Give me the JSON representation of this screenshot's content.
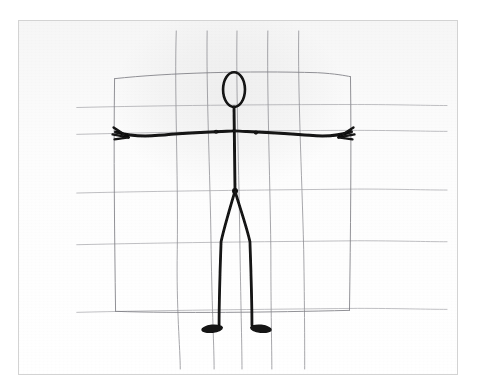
{
  "image": {
    "title": "Pencil sketch of a stick figure",
    "medium": "graphite pencil on gridded paper",
    "subject": "stick-figure human in arms-out standing pose",
    "width": 478,
    "height": 392,
    "background_color": "#ffffff"
  },
  "frame": {
    "name": "scan-border",
    "border_color": "#d3d3d3",
    "paper_color": "#fdfdfd",
    "left": 18,
    "top": 20,
    "width": 440,
    "height": 355
  },
  "grid": {
    "description": "hand-ruled pencil grid, slightly wavy lines",
    "line_color": "#8d8d93",
    "line_width": 0.9,
    "vertical_lines": [
      {
        "name": "grid-vline-1",
        "x_top": 158,
        "x_bottom": 162
      },
      {
        "name": "grid-vline-2",
        "x_top": 189,
        "x_bottom": 196
      },
      {
        "name": "grid-vline-3",
        "x_top": 219,
        "x_bottom": 224
      },
      {
        "name": "grid-vline-4",
        "x_top": 250,
        "x_bottom": 254
      },
      {
        "name": "grid-vline-5",
        "x_top": 281,
        "x_bottom": 287
      }
    ],
    "horizontal_lines": [
      {
        "name": "grid-hline-1",
        "y_left": 87,
        "y_right": 84
      },
      {
        "name": "grid-hline-2",
        "y_left": 113,
        "y_right": 110
      },
      {
        "name": "grid-hline-3",
        "y_left": 172,
        "y_right": 169
      },
      {
        "name": "grid-hline-4",
        "y_left": 224,
        "y_right": 221
      },
      {
        "name": "grid-hline-5",
        "y_left": 292,
        "y_right": 289
      }
    ]
  },
  "bounding_box": {
    "name": "proportion-box",
    "description": "light pencil rectangle enclosing the figure's span",
    "line_color": "#7e7e84",
    "left": 95,
    "top": 55,
    "right": 333,
    "bottom": 292
  },
  "figure": {
    "name": "stick-figure",
    "stroke_color": "#121212",
    "parts": [
      {
        "name": "head",
        "shape": "ellipse",
        "cx": 216,
        "cy": 69,
        "rx": 11,
        "ry": 17,
        "filled": false
      },
      {
        "name": "neck-and-spine",
        "shape": "line",
        "x1": 216,
        "y1": 86,
        "x2": 217,
        "y2": 170
      },
      {
        "name": "left-arm",
        "shape": "polyline",
        "points": "216,110 165,112 120,117 98,112"
      },
      {
        "name": "right-arm",
        "shape": "polyline",
        "points": "216,110 268,112 312,117 334,112"
      },
      {
        "name": "left-hand",
        "shape": "fork",
        "x": 98,
        "y": 112,
        "fingers": 3
      },
      {
        "name": "right-hand",
        "shape": "fork",
        "x": 334,
        "y": 112,
        "fingers": 3
      },
      {
        "name": "left-shoulder-joint",
        "shape": "dot",
        "cx": 198,
        "cy": 111
      },
      {
        "name": "right-shoulder-joint",
        "shape": "dot",
        "cx": 238,
        "cy": 112
      },
      {
        "name": "hip-joint",
        "shape": "dot",
        "cx": 217,
        "cy": 171
      },
      {
        "name": "left-leg",
        "shape": "polyline",
        "points": "217,171 203,222 202,307"
      },
      {
        "name": "right-leg",
        "shape": "polyline",
        "points": "217,171 232,222 233,307"
      },
      {
        "name": "left-foot",
        "shape": "ellipse-filled",
        "cx": 195,
        "cy": 310,
        "rx": 11,
        "ry": 4,
        "filled": true
      },
      {
        "name": "right-foot",
        "shape": "ellipse-filled",
        "cx": 244,
        "cy": 310,
        "rx": 11,
        "ry": 4,
        "filled": true
      }
    ]
  },
  "annotations": {
    "visible_text": "",
    "note": "no legible text or labels appear in the scan"
  }
}
